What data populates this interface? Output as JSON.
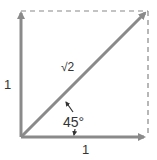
{
  "diagram": {
    "labels": {
      "left_side": "1",
      "bottom_side": "1",
      "diagonal": "√2",
      "angle": "45°"
    },
    "colors": {
      "arrow": "#8a8a8a",
      "dashed": "#888888",
      "text": "#333333"
    }
  }
}
